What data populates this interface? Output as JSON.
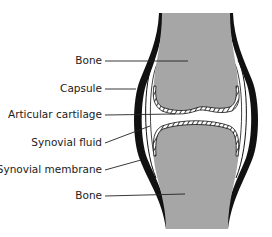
{
  "diagram": {
    "colors": {
      "bone": "#a6a6a6",
      "capsule": "#111111",
      "background": "#ffffff",
      "leader": "#222222"
    },
    "labels": [
      {
        "id": "bone-top",
        "text": "Bone",
        "right": 102,
        "y": 61
      },
      {
        "id": "capsule",
        "text": "Capsule",
        "right": 102,
        "y": 89
      },
      {
        "id": "articular-cartilage",
        "text": "Articular cartilage",
        "right": 102,
        "y": 115
      },
      {
        "id": "synovial-fluid",
        "text": "Synovial fluid",
        "right": 102,
        "y": 143
      },
      {
        "id": "synovial-membrane",
        "text": "Synovial membrane",
        "right": 102,
        "y": 170
      },
      {
        "id": "bone-bottom",
        "text": "Bone",
        "right": 102,
        "y": 196
      }
    ]
  }
}
